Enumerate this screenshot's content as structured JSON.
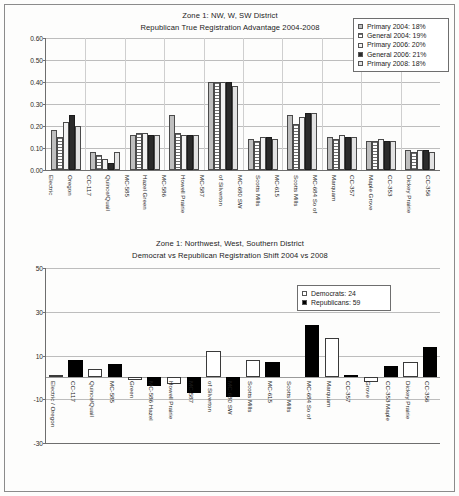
{
  "document": {
    "kind": "two-chart-report-page"
  },
  "top_chart": {
    "title_line1": "Zone 1: NW, W, SW District",
    "title_line2": "Republican True Registration Advantage 2004-2008",
    "legend": {
      "items": [
        {
          "label": "Primary 2004: 18%",
          "swatch": "light-gray-swatch"
        },
        {
          "label": "General 2004: 19%",
          "swatch": "hatched-swatch"
        },
        {
          "label": "Primary 2006: 20%",
          "swatch": "white-swatch"
        },
        {
          "label": "General 2006: 21%",
          "swatch": "black-swatch"
        },
        {
          "label": "Primary 2008: 18%",
          "swatch": "pale-gray-swatch"
        }
      ]
    }
  },
  "bottom_chart": {
    "title_line1": "Zone 1: Northwest, West, Southern District",
    "title_line2": "Democrat vs Republican Registration Shift 2004 vs 2008",
    "legend": {
      "items": [
        {
          "label": "Democrats: 24",
          "swatch": "white-swatch"
        },
        {
          "label": "Republicans: 59",
          "swatch": "black-swatch"
        }
      ]
    }
  },
  "chart_data": [
    {
      "type": "bar",
      "id": "republican-true-registration-advantage",
      "title": "Zone 1: NW, W, SW District — Republican True Registration Advantage 2004-2008",
      "xlabel": "",
      "ylabel": "",
      "ylim": [
        0.0,
        0.6
      ],
      "yticks": [
        "0.00",
        "0.10",
        "0.20",
        "0.30",
        "0.40",
        "0.50",
        "0.60"
      ],
      "grid": true,
      "legend_position": "top-right",
      "categories": [
        "Electric",
        "Oregon",
        "CC-117",
        "Quince/Quail",
        "MC-585",
        "Hazel Green",
        "MC-586",
        "Howell Prairie",
        "MC-587",
        "of Silverton",
        "MC-680 SW",
        "Scotts Mills",
        "MC-615",
        "Scotts Mills",
        "MC-684 So of",
        "Marquam",
        "CC-357",
        "Maple Grove",
        "CC-353",
        "Dickey Prairie",
        "CC-356"
      ],
      "series": [
        {
          "name": "Primary 2004: 18%",
          "values": [
            0.18,
            0.08,
            0.16,
            0.25,
            0.4,
            0.14,
            0.25,
            0.15,
            0.13,
            0.09
          ]
        },
        {
          "name": "General 2004: 19%",
          "values": [
            0.15,
            0.07,
            0.17,
            0.17,
            0.4,
            0.13,
            0.21,
            0.14,
            0.13,
            0.08
          ]
        },
        {
          "name": "Primary 2006: 20%",
          "values": [
            0.22,
            0.05,
            0.17,
            0.16,
            0.4,
            0.15,
            0.24,
            0.16,
            0.14,
            0.09
          ]
        },
        {
          "name": "General 2006: 21%",
          "values": [
            0.25,
            0.03,
            0.16,
            0.16,
            0.4,
            0.15,
            0.26,
            0.15,
            0.13,
            0.09
          ]
        },
        {
          "name": "Primary 2008: 18%",
          "values": [
            0.2,
            0.08,
            0.16,
            0.16,
            0.38,
            0.14,
            0.26,
            0.15,
            0.13,
            0.08
          ]
        }
      ],
      "group_labels": [
        "Electric / Oregon / CC-117",
        "Quince/Quail / MC-585",
        "Hazel Green / MC-586",
        "Howell Prairie / MC-587",
        "of Silverton / MC-680 SW",
        "Scotts Mills / MC-615",
        "Scotts Mills / MC-684 So of",
        "Marquam / CC-357",
        "Maple Grove / CC-353",
        "Dickey Prairie / CC-356"
      ]
    },
    {
      "type": "bar",
      "id": "democrat-vs-republican-registration-shift",
      "title": "Zone 1: Northwest, West, Southern District — Democrat vs Republican Registration Shift 2004 vs 2008",
      "xlabel": "",
      "ylabel": "",
      "ylim": [
        -30,
        50
      ],
      "yticks": [
        "50",
        "30",
        "10",
        "-10",
        "-30"
      ],
      "grid": true,
      "legend_position": "top-right",
      "categories": [
        "Electric / Oregon",
        "CC-117",
        "Quince/Quail",
        "MC-585",
        "Green",
        "MC-586 Hazel",
        "Howell Prairie",
        "MC-587",
        "of Silverton",
        "MC-680 SW",
        "Scotts Mills",
        "MC-615",
        "Scotts Mills",
        "MC-684 So of",
        "Marquam",
        "CC-357",
        "Grove",
        "CC-353 Maple",
        "Dickey Prairie",
        "CC-356"
      ],
      "series": [
        {
          "name": "Democrats: 24",
          "values": [
            1,
            0,
            4,
            0,
            -1,
            0,
            -3,
            0,
            12,
            0,
            8,
            0,
            0,
            0,
            18,
            0,
            -2,
            0,
            7,
            0
          ]
        },
        {
          "name": "Republicans: 59",
          "values": [
            0,
            8,
            0,
            6,
            0,
            -4,
            0,
            -7,
            0,
            -9,
            0,
            7,
            0,
            24,
            0,
            1,
            0,
            5,
            0,
            14
          ]
        }
      ]
    }
  ]
}
